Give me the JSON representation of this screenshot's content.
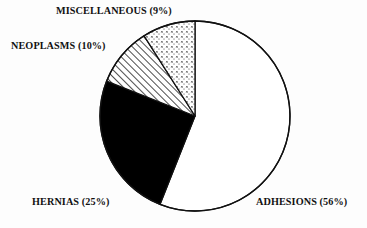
{
  "chart_data": {
    "type": "pie",
    "title": "",
    "subtitle": "",
    "xlabel": "",
    "ylabel": "",
    "legend_position": "none",
    "grid": false,
    "start_angle_deg": 0,
    "direction": "clockwise",
    "categories": [
      "ADHESIONS",
      "HERNIAS",
      "NEOPLASMS",
      "MISCELLANEOUS"
    ],
    "values": [
      56,
      25,
      10,
      9
    ],
    "value_unit": "percent",
    "slices": [
      {
        "name": "ADHESIONS",
        "value": 56,
        "label": "ADHESIONS (56%)",
        "fill": "solid-white",
        "color": "#ffffff",
        "stroke": "#111111"
      },
      {
        "name": "HERNIAS",
        "value": 25,
        "label": "HERNIAS (25%)",
        "fill": "solid-black",
        "color": "#000000",
        "stroke": "#111111"
      },
      {
        "name": "NEOPLASMS",
        "value": 10,
        "label": "NEOPLASMS (10%)",
        "fill": "diagonal-hatch",
        "color": "#ffffff",
        "stroke": "#111111"
      },
      {
        "name": "MISCELLANEOUS",
        "value": 9,
        "label": "MISCELLANEOUS (9%)",
        "fill": "fine-dot-cross",
        "color": "#ffffff",
        "stroke": "#111111"
      }
    ]
  },
  "labels": {
    "miscellaneous": "MISCELLANEOUS (9%)",
    "neoplasms": "NEOPLASMS (10%)",
    "hernias": "HERNIAS (25%)",
    "adhesions": "ADHESIONS (56%)"
  },
  "geometry": {
    "center_x": 195,
    "center_y": 116,
    "radius": 95
  },
  "colors": {
    "background": "#fdfdfd",
    "outline": "#111111",
    "text": "#111111",
    "filled_slice": "#000000",
    "empty_slice": "#ffffff"
  }
}
